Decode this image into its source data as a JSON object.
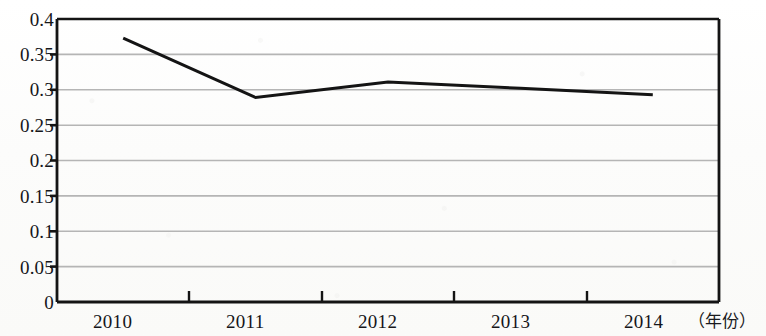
{
  "chart_data": {
    "type": "line",
    "title": "",
    "subtitle": "",
    "xlabel": "（年份）",
    "ylabel": "",
    "categories": [
      "2010",
      "2011",
      "2012",
      "2013",
      "2014"
    ],
    "x": [
      2010,
      2011,
      2012,
      2013,
      2014
    ],
    "series": [
      {
        "name": "",
        "values": [
          0.373,
          0.289,
          0.311,
          0.302,
          0.293
        ]
      }
    ],
    "values": [
      0.373,
      0.289,
      0.311,
      0.302,
      0.293
    ],
    "ylim": [
      0,
      0.4
    ],
    "ytick_labels": [
      "0",
      "0.05",
      "0.1",
      "0.15",
      "0.2",
      "0.25",
      "0.3",
      "0.35",
      "0.4"
    ],
    "ytick_values": [
      0,
      0.05,
      0.1,
      0.15,
      0.2,
      0.25,
      0.3,
      0.35,
      0.4
    ],
    "xtick_labels": [
      "2010",
      "2011",
      "2012",
      "2013",
      "2014"
    ],
    "grid": "horizontal",
    "legend": "none",
    "annotations": [],
    "colors": {
      "line": "#141414",
      "grid": "#b9b9b9",
      "axis": "#111111",
      "background": "#fdfdfc",
      "text": "#16161a"
    }
  },
  "axis": {
    "y_labels": {
      "v0": "0",
      "v1": "0.05",
      "v2": "0.1",
      "v3": "0.15",
      "v4": "0.2",
      "v5": "0.25",
      "v6": "0.3",
      "v7": "0.35",
      "v8": "0.4"
    },
    "x_labels": {
      "t0": "2010",
      "t1": "2011",
      "t2": "2012",
      "t3": "2013",
      "t4": "2014"
    },
    "x_unit": "（年份）"
  }
}
